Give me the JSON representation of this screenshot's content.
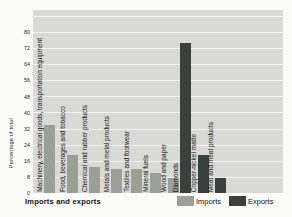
{
  "chart_data": {
    "type": "bar",
    "title": "Imports and exports",
    "ylabel": "Percentage of total",
    "ylim": [
      0,
      91
    ],
    "yticks": [
      80,
      72,
      64,
      56,
      48,
      40,
      32,
      24,
      16,
      8,
      0
    ],
    "grid_step": 8,
    "grid": true,
    "legend_position": "bottom-right",
    "categories": [
      "Machinery, electrical goods, transportation equipment",
      "Food, beverages and tobacco",
      "Chemical and rubber products",
      "Metals and metal products",
      "Textiles and footwear",
      "Mineral fuels",
      "Wood and paper",
      "Diamonds",
      "Copper-nickel matte",
      "Meat and meat products"
    ],
    "series": [
      {
        "name": "Imports",
        "values": [
          34,
          19,
          13,
          12,
          12,
          10,
          7.5,
          null,
          null,
          null
        ]
      },
      {
        "name": "Exports",
        "values": [
          null,
          null,
          null,
          null,
          null,
          null,
          null,
          74.5,
          19,
          7.5
        ]
      }
    ],
    "legend": [
      {
        "label": "Imports",
        "color": "#9aa096"
      },
      {
        "label": "Exports",
        "color": "#3a403b"
      }
    ],
    "colors": {
      "plot_background": "#d9d9d5",
      "gridline": "#f2f2ee",
      "imports_bar": "#9aa096",
      "exports_bar": "#3a403b",
      "text": "#141414"
    }
  }
}
